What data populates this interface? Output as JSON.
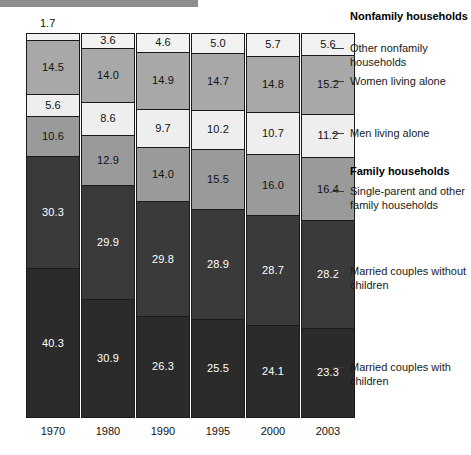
{
  "chart_data": {
    "type": "bar",
    "title": "",
    "subtitle": "",
    "xlabel": "",
    "ylabel": "",
    "ylim": [
      0,
      100
    ],
    "grid": false,
    "stacked": true,
    "stack_mode": "percent",
    "legend_position": "right",
    "categories": [
      "1970",
      "1980",
      "1990",
      "1995",
      "2000",
      "2003"
    ],
    "series": [
      {
        "name": "Other nonfamily households",
        "group": "Nonfamily households",
        "color": "#f2f2f2",
        "label_color": "#111111",
        "values": [
          1.7,
          3.6,
          4.6,
          5.0,
          5.7,
          5.6
        ]
      },
      {
        "name": "Women living alone",
        "group": "Nonfamily households",
        "color": "#a8a8a8",
        "label_color": "#111111",
        "values": [
          14.5,
          14.0,
          14.9,
          14.7,
          14.8,
          15.2
        ]
      },
      {
        "name": "Men living alone",
        "group": "Nonfamily households",
        "color": "#eeeeee",
        "label_color": "#111111",
        "values": [
          5.6,
          8.6,
          9.7,
          10.2,
          10.7,
          11.2
        ]
      },
      {
        "name": "Single-parent and other family households",
        "group": "Family households",
        "color": "#9a9a9a",
        "label_color": "#111111",
        "values": [
          10.6,
          12.9,
          14.0,
          15.5,
          16.0,
          16.4
        ]
      },
      {
        "name": "Married couples without children",
        "group": "Family households",
        "color": "#3a3a3a",
        "label_color": "#ffffff",
        "values": [
          30.3,
          29.9,
          29.8,
          28.9,
          28.7,
          28.2
        ]
      },
      {
        "name": "Married couples with children",
        "group": "Family households",
        "color": "#2b2b2b",
        "label_color": "#ffffff",
        "values": [
          40.3,
          30.9,
          26.3,
          25.5,
          24.1,
          23.3
        ]
      }
    ]
  },
  "legend": {
    "entries": [
      {
        "kind": "heading",
        "text": "Nonfamily households",
        "top": 10
      },
      {
        "kind": "item",
        "text": "Other nonfamily households",
        "top": 42,
        "tick_top": 48
      },
      {
        "kind": "item",
        "text": "Women living alone",
        "top": 75,
        "tick_top": 81
      },
      {
        "kind": "item",
        "text": "Men living alone",
        "top": 127,
        "tick_top": 133
      },
      {
        "kind": "heading",
        "text": "Family households",
        "top": 165,
        "tick_top": null
      },
      {
        "kind": "item",
        "text": "Single-parent and other family households",
        "top": 185,
        "tick_top": 191
      },
      {
        "kind": "item",
        "text": "Married couples without children",
        "top": 265,
        "tick_top": 271
      },
      {
        "kind": "item",
        "text": "Married couples with children",
        "top": 361,
        "tick_top": 367
      }
    ]
  },
  "layout": {
    "bar_left_positions": [
      26,
      81,
      136,
      191,
      246,
      301
    ],
    "outside_label_column_index": 0
  }
}
